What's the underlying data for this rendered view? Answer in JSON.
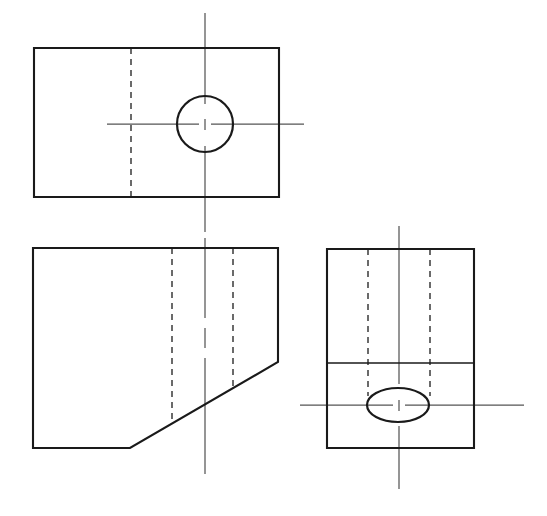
{
  "sheet": {
    "title": "Orthographic Projection Drawing",
    "width": 547,
    "height": 516,
    "background_color": "#ffffff",
    "line_color": "#1a1a1a",
    "hidden_line_color": "#3a3a3a",
    "center_line_color": "#555555"
  },
  "views": {
    "top": {
      "label": "Top View",
      "outline": {
        "x": 34,
        "y": 48,
        "width": 245,
        "height": 149,
        "points": "34,48 279,48 279,197 34,197 34,48"
      },
      "hidden_lines": [
        {
          "name": "vertical-hidden-edge",
          "x1": 131,
          "y1": 48,
          "x2": 131,
          "y2": 197
        }
      ],
      "circle": {
        "name": "through-hole",
        "cx": 205,
        "cy": 124,
        "r": 28
      },
      "center_lines": {
        "vertical": {
          "x1": 205,
          "y1": 13,
          "x2": 205,
          "y2": 232
        },
        "horizontal": {
          "x1": 107,
          "y1": 124,
          "x2": 304,
          "y2": 124
        }
      }
    },
    "front": {
      "label": "Front View",
      "outline": {
        "points": "33,248 278,248 278,362 130,448 33,448 33,248"
      },
      "chamfer": {
        "name": "chamfer-edge",
        "x1": 278,
        "y1": 362,
        "x2": 130,
        "y2": 448
      },
      "hidden_lines": [
        {
          "name": "left-hidden-edge",
          "x1": 172,
          "y1": 248,
          "x2": 172,
          "y2": 422
        },
        {
          "name": "right-hidden-edge",
          "x1": 233,
          "y1": 248,
          "x2": 233,
          "y2": 387
        }
      ],
      "center_lines": {
        "vertical": {
          "x1": 205,
          "y1": 238,
          "x2": 205,
          "y2": 474
        }
      }
    },
    "side": {
      "label": "Right Side View",
      "outline": {
        "x": 327,
        "y": 249,
        "width": 147,
        "height": 199,
        "points": "327,249 474,249 474,448 327,448 327,249"
      },
      "divider_line": {
        "name": "horizontal-visible-edge",
        "x1": 327,
        "y1": 363,
        "x2": 474,
        "y2": 363
      },
      "hidden_lines": [
        {
          "name": "left-hidden-edge",
          "x1": 368,
          "y1": 249,
          "x2": 368,
          "y2": 396
        },
        {
          "name": "right-hidden-edge",
          "x1": 430,
          "y1": 249,
          "x2": 430,
          "y2": 396
        }
      ],
      "ellipse": {
        "name": "through-hole-ellipse",
        "cx": 398,
        "cy": 405,
        "rx": 31,
        "ry": 17
      },
      "center_lines": {
        "vertical": {
          "x1": 399,
          "y1": 226,
          "x2": 399,
          "y2": 489
        },
        "horizontal": {
          "x1": 300,
          "y1": 405,
          "x2": 524,
          "y2": 405
        }
      }
    }
  }
}
